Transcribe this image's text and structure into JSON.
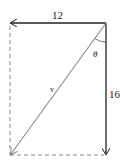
{
  "diagram": {
    "type": "vector-decomposition",
    "labels": {
      "horizontal_component": "12",
      "vertical_component": "16",
      "angle": "θ",
      "resultant": "v"
    },
    "colors": {
      "component": "#222222",
      "resultant": "#888888",
      "dashed": "#888888",
      "background": "#ffffff"
    }
  }
}
